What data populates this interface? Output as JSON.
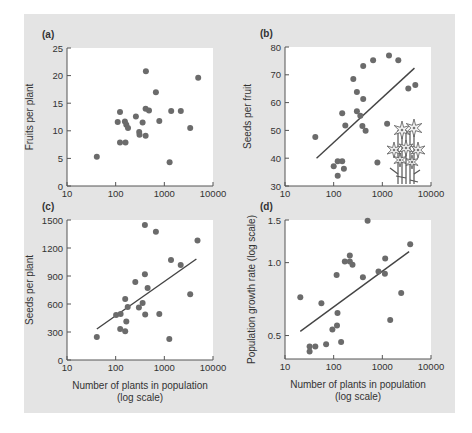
{
  "figure": {
    "background_color": "#e4e4e4",
    "plot_bg_color": "#ffffff",
    "point_color": "#6b6b6b",
    "line_color": "#444444",
    "axis_color": "#555555"
  },
  "chart_data": [
    {
      "panel": "(a)",
      "type": "scatter",
      "xlabel": "",
      "ylabel": "Fruits per plant",
      "xscale": "log",
      "xlim": [
        10,
        10000
      ],
      "xticks": [
        10,
        100,
        1000,
        10000
      ],
      "xtick_labels": [
        "10",
        "100",
        "1000",
        "10000"
      ],
      "ylim": [
        0,
        25
      ],
      "yscale": "linear",
      "yticks": [
        0,
        5,
        10,
        15,
        20,
        25
      ],
      "ytick_labels": [
        "0",
        "5",
        "10",
        "15",
        "20",
        "25"
      ],
      "grid": false,
      "points": [
        [
          41,
          5.3
        ],
        [
          110,
          11.6
        ],
        [
          123,
          13.4
        ],
        [
          123,
          7.9
        ],
        [
          159,
          7.9
        ],
        [
          155,
          11.7
        ],
        [
          165,
          11.1
        ],
        [
          179,
          10.5
        ],
        [
          261,
          12.6
        ],
        [
          358,
          11.5
        ],
        [
          304,
          9.8
        ],
        [
          309,
          9.3
        ],
        [
          413,
          9.1
        ],
        [
          419,
          20.8
        ],
        [
          413,
          14.0
        ],
        [
          484,
          13.7
        ],
        [
          670,
          17.0
        ],
        [
          788,
          11.8
        ],
        [
          1286,
          4.3
        ],
        [
          1384,
          13.6
        ],
        [
          2178,
          13.6
        ],
        [
          3400,
          10.5
        ],
        [
          4970,
          19.6
        ]
      ],
      "fit_line": null
    },
    {
      "panel": "(b)",
      "type": "scatter",
      "xlabel": "",
      "ylabel": "Seeds per fruit",
      "xscale": "log",
      "xlim": [
        10,
        10000
      ],
      "xticks": [
        10,
        100,
        1000,
        10000
      ],
      "xtick_labels": [
        "10",
        "100",
        "1000",
        "10000"
      ],
      "ylim": [
        30,
        80
      ],
      "yscale": "linear",
      "yticks": [
        30,
        40,
        50,
        60,
        70,
        80
      ],
      "ytick_labels": [
        "30",
        "40",
        "50",
        "60",
        "70",
        "80"
      ],
      "grid": false,
      "points": [
        [
          42,
          47.6
        ],
        [
          100,
          37.1
        ],
        [
          121,
          38.9
        ],
        [
          121,
          33.7
        ],
        [
          150,
          38.9
        ],
        [
          162,
          36.2
        ],
        [
          150,
          56.2
        ],
        [
          173,
          51.8
        ],
        [
          253,
          68.5
        ],
        [
          300,
          63.8
        ],
        [
          300,
          56.9
        ],
        [
          352,
          55.3
        ],
        [
          404,
          73.2
        ],
        [
          404,
          61.3
        ],
        [
          389,
          51.6
        ],
        [
          454,
          49.9
        ],
        [
          645,
          75.2
        ],
        [
          791,
          38.4
        ],
        [
          1255,
          52.4
        ],
        [
          1370,
          76.9
        ],
        [
          2129,
          75.2
        ],
        [
          3421,
          65.1
        ],
        [
          4751,
          66.3
        ]
      ],
      "fit_line": [
        [
          44.5,
          40.0
        ],
        [
          4570,
          72.4
        ]
      ],
      "annotation": "flower-illustration"
    },
    {
      "panel": "(c)",
      "type": "scatter",
      "xlabel": "Number of plants in population",
      "xlabel2": "(log scale)",
      "ylabel": "Seeds per plant",
      "xscale": "log",
      "xlim": [
        10,
        10000
      ],
      "xticks": [
        10,
        100,
        1000,
        10000
      ],
      "xtick_labels": [
        "10",
        "100",
        "1000",
        "10000"
      ],
      "ylim": [
        0,
        1500
      ],
      "yscale": "linear",
      "yticks": [
        0,
        300,
        600,
        900,
        1200,
        1500
      ],
      "ytick_labels": [
        "0",
        "300",
        "600",
        "900",
        "1200",
        "1500"
      ],
      "grid": false,
      "points": [
        [
          41,
          246
        ],
        [
          102,
          482
        ],
        [
          126,
          493
        ],
        [
          124,
          332
        ],
        [
          157,
          653
        ],
        [
          157,
          307
        ],
        [
          165,
          414
        ],
        [
          177,
          568
        ],
        [
          253,
          836
        ],
        [
          300,
          564
        ],
        [
          358,
          611
        ],
        [
          398,
          1446
        ],
        [
          398,
          918
        ],
        [
          404,
          489
        ],
        [
          454,
          771
        ],
        [
          670,
          1375
        ],
        [
          788,
          493
        ],
        [
          1262,
          225
        ],
        [
          1374,
          1071
        ],
        [
          2168,
          1018
        ],
        [
          3400,
          704
        ],
        [
          4800,
          1279
        ]
      ],
      "fit_line": [
        [
          41,
          332
        ],
        [
          4560,
          1082
        ]
      ]
    },
    {
      "panel": "(d)",
      "type": "scatter",
      "xlabel": "Number of plants in population",
      "xlabel2": "(log scale)",
      "ylabel": "Population growth rate (log scale)",
      "xscale": "log",
      "xlim": [
        10,
        10000
      ],
      "xticks": [
        10,
        100,
        1000,
        10000
      ],
      "xtick_labels": [
        "10",
        "100",
        "1000",
        "10000"
      ],
      "ylim": [
        0.4,
        1.5
      ],
      "yscale": "log",
      "yticks": [
        0.5,
        1.0,
        1.5
      ],
      "ytick_labels": [
        "0.5",
        "1.0",
        "1.5"
      ],
      "grid": false,
      "points": [
        [
          20.6,
          0.72
        ],
        [
          32,
          0.45
        ],
        [
          32,
          0.43
        ],
        [
          42,
          0.45
        ],
        [
          56,
          0.68
        ],
        [
          70,
          0.46
        ],
        [
          94,
          0.53
        ],
        [
          117,
          0.55
        ],
        [
          120,
          0.62
        ],
        [
          115,
          0.89
        ],
        [
          142,
          0.47
        ],
        [
          169,
          1.01
        ],
        [
          215,
          1.07
        ],
        [
          215,
          1.01
        ],
        [
          244,
          0.98
        ],
        [
          398,
          0.87
        ],
        [
          497,
          1.49
        ],
        [
          834,
          0.92
        ],
        [
          1143,
          1.04
        ],
        [
          1131,
          0.9
        ],
        [
          1448,
          0.58
        ],
        [
          2445,
          0.75
        ],
        [
          3733,
          1.19
        ]
      ],
      "fit_line": [
        [
          20.6,
          0.52
        ],
        [
          3550,
          1.11
        ]
      ]
    }
  ],
  "layout": {
    "panels": [
      {
        "plot": [
          67,
          48,
          213,
          186
        ]
      },
      {
        "plot": [
          285,
          47,
          431,
          186
        ]
      },
      {
        "plot": [
          67,
          220,
          213,
          360
        ]
      },
      {
        "plot": [
          285,
          220,
          431,
          359
        ]
      }
    ]
  }
}
